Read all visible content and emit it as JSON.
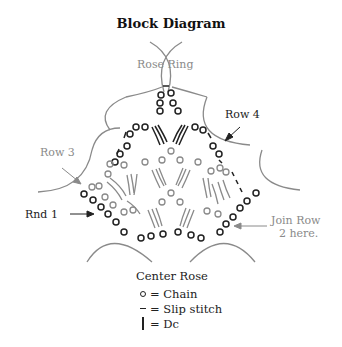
{
  "title": "Block Diagram",
  "labels": {
    "rose_ring": "Rose Ring",
    "row4": "Row 4",
    "row3": "Row 3",
    "rnd1": "Rnd 1",
    "join_row_line1": "Join Row",
    "join_row_line2": "2 here."
  },
  "legend": {
    "heading": "Center Rose",
    "items": [
      {
        "symbol": "chain-icon",
        "text": "= Chain"
      },
      {
        "symbol": "slip-stitch-icon",
        "text": "= Slip stitch"
      },
      {
        "symbol": "dc-icon",
        "text": "= Dc"
      }
    ]
  },
  "colors": {
    "dark_stitch": "#222222",
    "grey_stitch": "#8a8a8a",
    "arc": "#8a8a8a"
  }
}
